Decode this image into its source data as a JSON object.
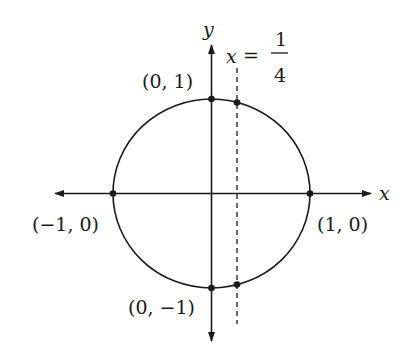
{
  "diagram": {
    "type": "unit-circle-with-vertical-line",
    "axes": {
      "x_label": "x",
      "y_label": "y"
    },
    "line": {
      "label_lhs": "x",
      "label_eq": "=",
      "numerator": "1",
      "denominator": "4",
      "x_value": 0.25,
      "style": "dashed"
    },
    "points": [
      {
        "label": "(0, 1)",
        "x": 0,
        "y": 1
      },
      {
        "label": "(−1, 0)",
        "x": -1,
        "y": 0
      },
      {
        "label": "(1, 0)",
        "x": 1,
        "y": 0
      },
      {
        "label": "(0, −1)",
        "x": 0,
        "y": -1
      }
    ],
    "intersections": [
      {
        "x": 0.25,
        "y": 0.968
      },
      {
        "x": 0.25,
        "y": -0.968
      }
    ],
    "colors": {
      "stroke": "#1a1a1a",
      "background": "#ffffff"
    }
  }
}
